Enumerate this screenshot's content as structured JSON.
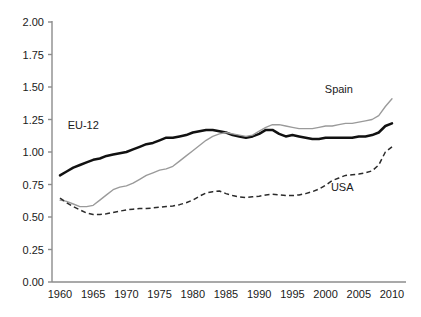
{
  "chart_data": {
    "type": "line",
    "title": "",
    "subtitle": "",
    "xlabel": "",
    "ylabel": "",
    "xlim": [
      1959,
      2011
    ],
    "ylim": [
      0.0,
      2.0
    ],
    "ytick_values": [
      0.0,
      0.25,
      0.5,
      0.75,
      1.0,
      1.25,
      1.5,
      1.75,
      2.0
    ],
    "ytick_labels": [
      "0.00",
      "0.25",
      "0.50",
      "0.75",
      "1.00",
      "1.25",
      "1.50",
      "1.75",
      "2.00"
    ],
    "xtick_values": [
      1960,
      1965,
      1970,
      1975,
      1980,
      1985,
      1990,
      1995,
      2000,
      2005,
      2010
    ],
    "xtick_labels": [
      "1960",
      "1965",
      "1970",
      "1975",
      "1980",
      "1985",
      "1990",
      "1995",
      "2000",
      "2005",
      "2010"
    ],
    "grid": false,
    "legend_position": "inline-annotations",
    "x": [
      1960,
      1961,
      1962,
      1963,
      1964,
      1965,
      1966,
      1967,
      1968,
      1969,
      1970,
      1971,
      1972,
      1973,
      1974,
      1975,
      1976,
      1977,
      1978,
      1979,
      1980,
      1981,
      1982,
      1983,
      1984,
      1985,
      1986,
      1987,
      1988,
      1989,
      1990,
      1991,
      1992,
      1993,
      1994,
      1995,
      1996,
      1997,
      1998,
      1999,
      2000,
      2001,
      2002,
      2003,
      2004,
      2005,
      2006,
      2007,
      2008,
      2009,
      2010
    ],
    "series": [
      {
        "name": "EU-12",
        "style": "solid-thick-black",
        "color": "#111111",
        "label_text": "EU-12",
        "values": [
          0.82,
          0.85,
          0.88,
          0.9,
          0.92,
          0.94,
          0.95,
          0.97,
          0.98,
          0.99,
          1.0,
          1.02,
          1.04,
          1.06,
          1.07,
          1.09,
          1.11,
          1.11,
          1.12,
          1.13,
          1.15,
          1.16,
          1.17,
          1.17,
          1.16,
          1.15,
          1.13,
          1.12,
          1.11,
          1.12,
          1.14,
          1.17,
          1.17,
          1.14,
          1.12,
          1.13,
          1.12,
          1.11,
          1.1,
          1.1,
          1.11,
          1.11,
          1.11,
          1.11,
          1.11,
          1.12,
          1.12,
          1.13,
          1.15,
          1.2,
          1.22
        ]
      },
      {
        "name": "Spain",
        "style": "solid-thin-gray",
        "color": "#9a9a9a",
        "label_text": "Spain",
        "values": [
          0.63,
          0.62,
          0.6,
          0.58,
          0.58,
          0.59,
          0.63,
          0.67,
          0.71,
          0.73,
          0.74,
          0.76,
          0.79,
          0.82,
          0.84,
          0.86,
          0.87,
          0.89,
          0.93,
          0.97,
          1.01,
          1.05,
          1.09,
          1.12,
          1.14,
          1.15,
          1.14,
          1.13,
          1.12,
          1.13,
          1.16,
          1.19,
          1.21,
          1.21,
          1.2,
          1.19,
          1.18,
          1.18,
          1.18,
          1.19,
          1.2,
          1.2,
          1.21,
          1.22,
          1.22,
          1.23,
          1.24,
          1.25,
          1.28,
          1.35,
          1.41
        ]
      },
      {
        "name": "USA",
        "style": "dashed-black",
        "color": "#2b2b2b",
        "label_text": "USA",
        "values": [
          0.645,
          0.61,
          0.58,
          0.555,
          0.53,
          0.52,
          0.52,
          0.525,
          0.535,
          0.545,
          0.555,
          0.56,
          0.565,
          0.565,
          0.57,
          0.575,
          0.58,
          0.585,
          0.595,
          0.61,
          0.63,
          0.66,
          0.685,
          0.695,
          0.7,
          0.68,
          0.665,
          0.655,
          0.65,
          0.655,
          0.66,
          0.67,
          0.675,
          0.67,
          0.665,
          0.665,
          0.67,
          0.68,
          0.695,
          0.715,
          0.745,
          0.78,
          0.8,
          0.82,
          0.825,
          0.83,
          0.84,
          0.855,
          0.9,
          1.0,
          1.04
        ]
      }
    ],
    "annotations": [
      {
        "text": "EU-12",
        "x_year": 1963.5,
        "y_value": 1.18
      },
      {
        "text": "Spain",
        "x_year": 2002.0,
        "y_value": 1.455
      },
      {
        "text": "USA",
        "x_year": 2002.5,
        "y_value": 0.7
      }
    ]
  }
}
